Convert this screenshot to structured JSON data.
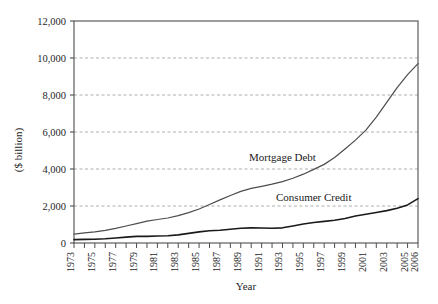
{
  "chart_data": {
    "type": "line",
    "title": "",
    "xlabel": "Year",
    "ylabel": "($ billion)",
    "ylim": [
      0,
      12000
    ],
    "xlim": [
      1973,
      2006
    ],
    "grid": true,
    "grid_axis": "y",
    "legend_position": "inline-annotations",
    "ytick_labels": [
      "12,000",
      "10,000",
      "8,000",
      "6,000",
      "4,000",
      "2,000",
      "0"
    ],
    "ytick_values": [
      12000,
      10000,
      8000,
      6000,
      4000,
      2000,
      0
    ],
    "xtick_labels": [
      "1973",
      "1975",
      "1977",
      "1979",
      "1981",
      "1983",
      "1985",
      "1987",
      "1989",
      "1991",
      "1993",
      "1995",
      "1997",
      "1999",
      "2001",
      "2003",
      "2005",
      "2006"
    ],
    "x": [
      1973,
      1974,
      1975,
      1976,
      1977,
      1978,
      1979,
      1980,
      1981,
      1982,
      1983,
      1984,
      1985,
      1986,
      1987,
      1988,
      1989,
      1990,
      1991,
      1992,
      1993,
      1994,
      1995,
      1996,
      1997,
      1998,
      1999,
      2000,
      2001,
      2002,
      2003,
      2004,
      2005,
      2006
    ],
    "series": [
      {
        "name": "Mortgage Debt",
        "color": "#4d4d4d",
        "line_width": 1.2,
        "label_x": 1993,
        "label_y": 4450,
        "values": [
          480,
          550,
          600,
          680,
          790,
          920,
          1050,
          1180,
          1270,
          1350,
          1480,
          1640,
          1840,
          2080,
          2330,
          2570,
          2790,
          2950,
          3060,
          3180,
          3320,
          3500,
          3720,
          3980,
          4250,
          4620,
          5080,
          5560,
          6100,
          6800,
          7600,
          8400,
          9100,
          9700
        ]
      },
      {
        "name": "Consumer Credit",
        "color": "#1a1a1a",
        "line_width": 1.6,
        "label_x": 1996,
        "label_y": 2280,
        "values": [
          180,
          195,
          205,
          230,
          270,
          320,
          360,
          360,
          380,
          390,
          440,
          520,
          600,
          660,
          690,
          740,
          800,
          820,
          810,
          800,
          820,
          920,
          1030,
          1110,
          1170,
          1230,
          1320,
          1460,
          1550,
          1650,
          1750,
          1880,
          2060,
          2400
        ]
      }
    ]
  }
}
